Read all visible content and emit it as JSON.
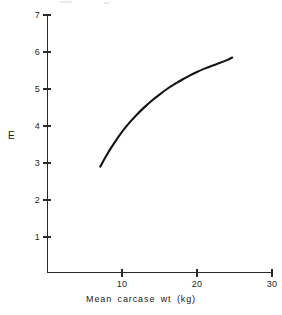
{
  "chart_data": {
    "type": "line",
    "title": "",
    "xlabel": "Mean carcase wt (kg)",
    "ylabel": "E",
    "xlim": [
      0,
      30
    ],
    "ylim": [
      0,
      7
    ],
    "grid": false,
    "legend": "none",
    "xticks": [
      "10",
      "20",
      "30"
    ],
    "xtick_values": [
      10,
      20,
      30
    ],
    "yticks": [
      "1",
      "2",
      "3",
      "4",
      "5",
      "6",
      "7"
    ],
    "ytick_values": [
      1,
      2,
      3,
      4,
      5,
      6,
      7
    ],
    "series": [
      {
        "name": "E vs mean carcase wt",
        "x": [
          7.1,
          8.0,
          9.0,
          10.0,
          11.0,
          12.0,
          13.0,
          14.0,
          15.0,
          16.0,
          17.0,
          18.0,
          19.0,
          20.0,
          21.0,
          22.0,
          23.0,
          24.0,
          24.7
        ],
        "values": [
          2.9,
          3.23,
          3.55,
          3.84,
          4.09,
          4.31,
          4.51,
          4.69,
          4.85,
          5.0,
          5.13,
          5.25,
          5.36,
          5.46,
          5.55,
          5.63,
          5.7,
          5.78,
          5.85
        ]
      }
    ],
    "curve_start": {
      "x": 7.1,
      "y": 2.9
    },
    "curve_end": {
      "x": 24.7,
      "y": 5.85
    },
    "curve_shape": "monotonic increasing, concave down (diminishing returns)",
    "colors": {
      "curve": "#141414",
      "axis": "#2a2a2a",
      "background": "#ffffff"
    }
  },
  "axes": {
    "y_label": "E",
    "x_title": "Mean carcase wt (kg)",
    "y_tick_labels": [
      "7",
      "6",
      "5",
      "4",
      "3",
      "2",
      "1"
    ],
    "x_tick_labels": [
      "10",
      "20",
      "30"
    ]
  }
}
